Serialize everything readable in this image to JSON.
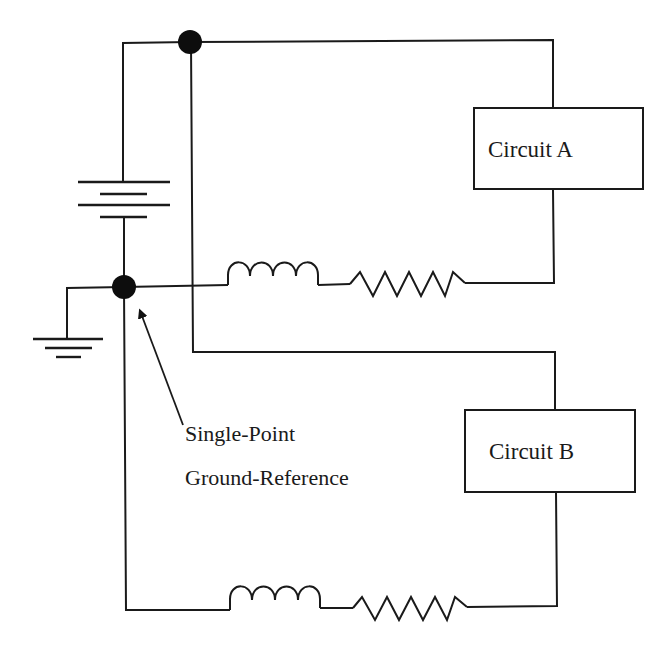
{
  "diagram": {
    "components": {
      "circuit_a": {
        "label": "Circuit A"
      },
      "circuit_b": {
        "label": "Circuit B"
      },
      "battery": {
        "type": "battery",
        "cells": 2
      },
      "ground": {
        "type": "ground-symbol"
      },
      "inductor_a": {
        "type": "inductor",
        "turns": 4
      },
      "resistor_a": {
        "type": "resistor",
        "zigzags": 5
      },
      "inductor_b": {
        "type": "inductor",
        "turns": 4
      },
      "resistor_b": {
        "type": "resistor",
        "zigzags": 5
      },
      "junction_top": {
        "type": "junction-dot"
      },
      "junction_ground": {
        "type": "junction-dot"
      }
    },
    "annotation": {
      "line1": "Single-Point",
      "line2": "Ground-Reference"
    },
    "colors": {
      "line": "#1a1a1a",
      "background": "#ffffff"
    }
  }
}
